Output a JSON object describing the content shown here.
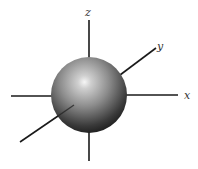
{
  "diagram": {
    "type": "s-orbital",
    "axes": {
      "z": {
        "label": "z"
      },
      "y": {
        "label": "y"
      },
      "x": {
        "label": "x"
      }
    },
    "colors": {
      "axis": "#1a1a1a",
      "sphere_highlight": "#f4f4f4",
      "sphere_mid": "#8a8a8a",
      "sphere_shadow": "#1c1c1c",
      "background": "#ffffff"
    }
  }
}
